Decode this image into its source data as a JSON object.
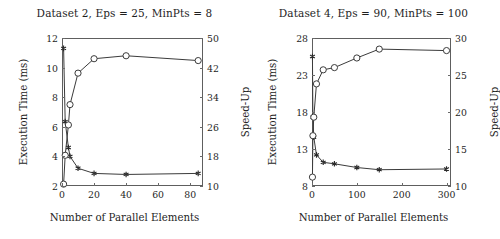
{
  "figure": {
    "panels": [
      {
        "title": "Dataset 2, Eps = 25, MinPts = 8",
        "xlabel": "Number of Parallel Elements",
        "ylabel_left": "Execution Time (ms)",
        "ylabel_right": "Speed-Up",
        "xticks": [
          "0",
          "20",
          "40",
          "60",
          "80"
        ],
        "yticks_left": [
          "2",
          "4",
          "6",
          "8",
          "10",
          "12"
        ],
        "yticks_right": [
          "10",
          "18",
          "26",
          "34",
          "42",
          "50"
        ]
      },
      {
        "title": "Dataset 4, Eps = 90, MinPts = 100",
        "xlabel": "Number of Parallel Elements",
        "ylabel_left": "Execution Time (ms)",
        "ylabel_right": "Speed-Up",
        "xticks": [
          "0",
          "100",
          "200",
          "300"
        ],
        "yticks_left": [
          "8",
          "13",
          "18",
          "23",
          "28"
        ],
        "yticks_right": [
          "10",
          "15",
          "20",
          "25",
          "30"
        ]
      }
    ]
  },
  "chart_data": [
    {
      "type": "line",
      "title": "Dataset 2, Eps = 25, MinPts = 8",
      "xlabel": "Number of Parallel Elements",
      "ylabel": "Execution Time (ms)",
      "ylabel_secondary": "Speed-Up",
      "grid": false,
      "legend": "none",
      "xlim": [
        0,
        88
      ],
      "ylim": [
        2,
        12
      ],
      "ylim_secondary": [
        10,
        50
      ],
      "xticks": [
        0,
        20,
        40,
        60,
        80
      ],
      "yticks": [
        2,
        4,
        6,
        8,
        10,
        12
      ],
      "yticks_secondary": [
        10,
        18,
        26,
        34,
        42,
        50
      ],
      "series": [
        {
          "name": "Execution Time (ms)",
          "axis": "left",
          "marker": "star",
          "x": [
            1,
            2,
            4,
            5,
            10,
            20,
            40,
            85
          ],
          "values": [
            11.3,
            6.35,
            4.6,
            4.0,
            3.2,
            2.85,
            2.78,
            2.85
          ]
        },
        {
          "name": "Speed-Up",
          "axis": "right",
          "marker": "circle",
          "x": [
            1,
            2,
            4,
            5,
            10,
            20,
            40,
            85
          ],
          "values": [
            10.5,
            18.3,
            26.5,
            32.0,
            40.5,
            44.4,
            45.2,
            43.9
          ]
        }
      ]
    },
    {
      "type": "line",
      "title": "Dataset 4, Eps = 90, MinPts = 100",
      "xlabel": "Number of Parallel Elements",
      "ylabel": "Execution Time (ms)",
      "ylabel_secondary": "Speed-Up",
      "grid": false,
      "legend": "none",
      "xlim": [
        0,
        310
      ],
      "ylim": [
        8,
        28
      ],
      "ylim_secondary": [
        10,
        30
      ],
      "xticks": [
        0,
        100,
        200,
        300
      ],
      "yticks": [
        8,
        13,
        18,
        23,
        28
      ],
      "yticks_secondary": [
        10,
        15,
        20,
        25,
        30
      ],
      "series": [
        {
          "name": "Execution Time (ms)",
          "axis": "left",
          "marker": "star",
          "x": [
            1,
            2,
            4,
            10,
            25,
            50,
            100,
            150,
            300
          ],
          "values": [
            25.5,
            17.3,
            14.6,
            12.2,
            11.2,
            11.0,
            10.5,
            10.2,
            10.3
          ]
        },
        {
          "name": "Speed-Up",
          "axis": "right",
          "marker": "circle",
          "x": [
            1,
            2,
            4,
            10,
            25,
            50,
            100,
            150,
            300
          ],
          "values": [
            11.2,
            16.8,
            19.3,
            23.8,
            25.7,
            26.0,
            27.3,
            28.5,
            28.3
          ]
        }
      ]
    }
  ]
}
